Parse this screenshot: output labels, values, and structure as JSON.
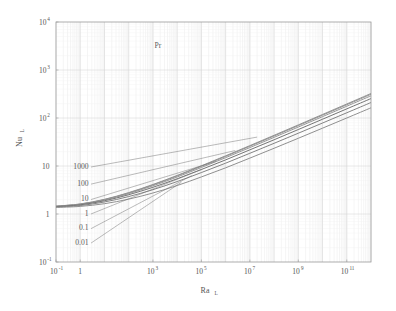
{
  "chart_data": {
    "type": "line",
    "title": "",
    "xlabel": "Ra_L",
    "ylabel": "Nu_L",
    "xlabel_base": "Ra",
    "xlabel_sub": "L",
    "ylabel_base": "Nu",
    "ylabel_sub": "L",
    "xscale": "log",
    "yscale": "log",
    "xlim": [
      0.1,
      1000000000000.0
    ],
    "ylim": [
      0.1,
      10000
    ],
    "grid": true,
    "grid_minor": true,
    "legend_position": "inside-upper-left-leader-lines",
    "legend_title": "Pr",
    "x_tick_labels": [
      {
        "value": 0.1,
        "mantissa": "10",
        "exponent": "-1"
      },
      {
        "value": 1,
        "mantissa": "1",
        "exponent": ""
      },
      {
        "value": 1000,
        "mantissa": "10",
        "exponent": "3"
      },
      {
        "value": 100000,
        "mantissa": "10",
        "exponent": "5"
      },
      {
        "value": 10000000,
        "mantissa": "10",
        "exponent": "7"
      },
      {
        "value": 1000000000,
        "mantissa": "10",
        "exponent": "9"
      },
      {
        "value": 100000000000,
        "mantissa": "10",
        "exponent": "11"
      }
    ],
    "y_tick_labels": [
      {
        "value": 0.1,
        "mantissa": "10",
        "exponent": "-1"
      },
      {
        "value": 1,
        "mantissa": "1",
        "exponent": ""
      },
      {
        "value": 10,
        "mantissa": "10",
        "exponent": ""
      },
      {
        "value": 100,
        "mantissa": "10",
        "exponent": "2"
      },
      {
        "value": 1000,
        "mantissa": "10",
        "exponent": "3"
      },
      {
        "value": 10000,
        "mantissa": "10",
        "exponent": "4"
      }
    ],
    "series": [
      {
        "name": "1000",
        "label": "1000",
        "color": "#8c8c8c",
        "points": [
          [
            0.1,
            1.46
          ],
          [
            1,
            1.62
          ],
          [
            10,
            2.02
          ],
          [
            100,
            2.79
          ],
          [
            1000,
            4.12
          ],
          [
            10000,
            6.36
          ],
          [
            100000,
            10.1
          ],
          [
            1000000,
            16.3
          ],
          [
            10000000,
            26.6
          ],
          [
            100000000,
            43.6
          ],
          [
            1000000000,
            71.8
          ],
          [
            10000000000,
            118.5
          ],
          [
            100000000000,
            196.0
          ],
          [
            1000000000000,
            324.0
          ]
        ]
      },
      {
        "name": "100",
        "label": "100",
        "color": "#8f8f8f",
        "points": [
          [
            0.1,
            1.455
          ],
          [
            1,
            1.608
          ],
          [
            10,
            1.995
          ],
          [
            100,
            2.74
          ],
          [
            1000,
            4.03
          ],
          [
            10000,
            6.2
          ],
          [
            100000,
            9.83
          ],
          [
            1000000,
            15.8
          ],
          [
            10000000,
            25.8
          ],
          [
            100000000,
            42.2
          ],
          [
            1000000000,
            69.4
          ],
          [
            10000000000,
            114.5
          ],
          [
            100000000000,
            189.0
          ],
          [
            1000000000000,
            312.0
          ]
        ]
      },
      {
        "name": "10",
        "label": "10",
        "color": "#939393",
        "points": [
          [
            0.1,
            1.44
          ],
          [
            1,
            1.59
          ],
          [
            10,
            1.955
          ],
          [
            100,
            2.66
          ],
          [
            1000,
            3.87
          ],
          [
            10000,
            5.9
          ],
          [
            100000,
            9.3
          ],
          [
            1000000,
            14.9
          ],
          [
            10000000,
            24.2
          ],
          [
            100000000,
            39.5
          ],
          [
            1000000000,
            64.8
          ],
          [
            10000000000,
            106.8
          ],
          [
            100000000000,
            176.0
          ],
          [
            1000000000000,
            290.0
          ]
        ]
      },
      {
        "name": "1",
        "label": "1",
        "color": "#6e6e6e",
        "points": [
          [
            0.1,
            1.42
          ],
          [
            1,
            1.55
          ],
          [
            10,
            1.885
          ],
          [
            100,
            2.52
          ],
          [
            1000,
            3.6
          ],
          [
            10000,
            5.42
          ],
          [
            100000,
            8.46
          ],
          [
            1000000,
            13.4
          ],
          [
            10000000,
            21.7
          ],
          [
            100000000,
            35.2
          ],
          [
            1000000000,
            57.5
          ],
          [
            10000000000,
            94.3
          ],
          [
            100000000000,
            155.0
          ],
          [
            1000000000000,
            254.0
          ]
        ]
      },
      {
        "name": "0.1",
        "label": "0.1",
        "color": "#7c7c7c",
        "points": [
          [
            0.1,
            1.4
          ],
          [
            1,
            1.5
          ],
          [
            10,
            1.78
          ],
          [
            100,
            2.31
          ],
          [
            1000,
            3.21
          ],
          [
            10000,
            4.74
          ],
          [
            100000,
            7.3
          ],
          [
            1000000,
            11.45
          ],
          [
            10000000,
            18.4
          ],
          [
            100000000,
            29.7
          ],
          [
            1000000000,
            48.2
          ],
          [
            10000000000,
            78.6
          ],
          [
            100000000000,
            128.5
          ],
          [
            1000000000000,
            210.0
          ]
        ]
      },
      {
        "name": "0.01",
        "label": "0.01",
        "color": "#8a8a8a",
        "points": [
          [
            0.1,
            1.37
          ],
          [
            1,
            1.44
          ],
          [
            10,
            1.64
          ],
          [
            100,
            2.04
          ],
          [
            1000,
            2.74
          ],
          [
            10000,
            3.92
          ],
          [
            100000,
            5.92
          ],
          [
            1000000,
            9.16
          ],
          [
            10000000,
            14.6
          ],
          [
            100000000,
            23.4
          ],
          [
            1000000000,
            37.8
          ],
          [
            10000000000,
            61.4
          ],
          [
            100000000000,
            100.0
          ],
          [
            1000000000000,
            163.0
          ]
        ]
      }
    ],
    "annotations": [
      {
        "label": "Pr",
        "label_x": 0.0,
        "label_y": 0.0,
        "is_title": true
      },
      {
        "label": "1000",
        "anchor_x": 2.2,
        "anchor_y": 10.0,
        "target_x": 20000000.0,
        "target_y": 40.0
      },
      {
        "label": "100",
        "anchor_x": 2.2,
        "anchor_y": 4.4,
        "target_x": 2500000.0,
        "target_y": 21.0
      },
      {
        "label": "10",
        "anchor_x": 2.2,
        "anchor_y": 2.1,
        "target_x": 400000.0,
        "target_y": 12.5
      },
      {
        "label": "1",
        "anchor_x": 2.2,
        "anchor_y": 1.05,
        "target_x": 110000.0,
        "target_y": 8.6
      },
      {
        "label": "0.1",
        "anchor_x": 2.2,
        "anchor_y": 0.52,
        "target_x": 40000.0,
        "target_y": 6.3
      },
      {
        "label": "0.01",
        "anchor_x": 2.2,
        "anchor_y": 0.26,
        "target_x": 15000.0,
        "target_y": 4.6
      }
    ]
  },
  "style": {
    "frame_color": "#9a9a9a",
    "grid_major_color": "#d6d6d6",
    "grid_minor_color": "#ebebeb",
    "background": "#ffffff",
    "text_color": "#555555",
    "leader_color": "#777777"
  }
}
